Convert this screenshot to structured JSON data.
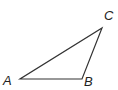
{
  "diagram": {
    "type": "triangle",
    "stroke_color": "#333333",
    "vertices": [
      {
        "label": "A",
        "x": 20,
        "y": 79
      },
      {
        "label": "B",
        "x": 82,
        "y": 79
      },
      {
        "label": "C",
        "x": 102,
        "y": 28
      }
    ]
  }
}
